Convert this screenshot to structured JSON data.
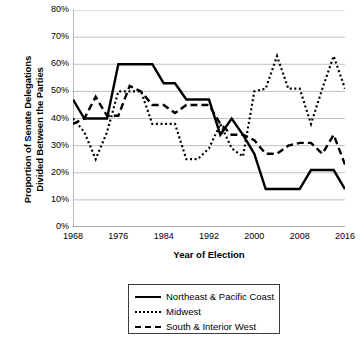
{
  "chart_data": {
    "type": "line",
    "title": "",
    "xlabel": "Year of Election",
    "ylabel": "Proportion of Senate Delegations Divided Between the Parties",
    "ylabel_line1": "Proportion of Senate Delegations",
    "ylabel_line2": "Divided Between the Parties",
    "xlim": [
      1968,
      2016
    ],
    "ylim": [
      0,
      80
    ],
    "ytick_labels": [
      "0%",
      "10%",
      "20%",
      "30%",
      "40%",
      "50%",
      "60%",
      "70%",
      "80%"
    ],
    "ytick_values": [
      0,
      10,
      20,
      30,
      40,
      50,
      60,
      70,
      80
    ],
    "xtick_labels": [
      "1968",
      "1976",
      "1984",
      "1992",
      "2000",
      "2008",
      "2016"
    ],
    "xtick_values": [
      1968,
      1976,
      1984,
      1992,
      2000,
      2008,
      2016
    ],
    "grid": "horizontal",
    "legend_position": "below-plot",
    "x": [
      1968,
      1970,
      1972,
      1974,
      1976,
      1978,
      1980,
      1982,
      1984,
      1986,
      1988,
      1990,
      1992,
      1994,
      1996,
      1998,
      2000,
      2002,
      2004,
      2006,
      2008,
      2010,
      2012,
      2014,
      2016
    ],
    "series": [
      {
        "name": "Northeast & Pacific Coast",
        "style": "solid",
        "color": "#000000",
        "values": [
          47,
          40,
          40,
          40,
          60,
          60,
          60,
          60,
          53,
          53,
          47,
          47,
          47,
          34,
          40,
          34,
          27,
          14,
          14,
          14,
          14,
          21,
          21,
          21,
          14
        ]
      },
      {
        "name": "Midwest",
        "style": "dotted",
        "color": "#000000",
        "values": [
          40,
          35,
          25,
          35,
          50,
          50,
          50,
          38,
          38,
          38,
          25,
          25,
          29,
          38,
          29,
          26,
          50,
          51,
          63,
          51,
          51,
          38,
          51,
          63,
          51
        ]
      },
      {
        "name": "South & Interior West",
        "style": "dashed",
        "color": "#000000",
        "values": [
          38,
          40,
          48,
          41,
          41,
          52,
          50,
          45,
          45,
          42,
          45,
          45,
          45,
          38,
          34,
          34,
          32,
          27,
          27,
          30,
          31,
          31,
          27,
          34,
          23
        ]
      }
    ],
    "series_late_midwest": [
      51,
      56,
      60,
      51,
      63,
      75,
      69,
      56,
      51
    ],
    "notes": ""
  },
  "legend": {
    "items": [
      {
        "label": "Northeast & Pacific Coast",
        "style": "solid"
      },
      {
        "label": "Midwest",
        "style": "dotted"
      },
      {
        "label": "South & Interior West",
        "style": "dashed"
      }
    ]
  }
}
